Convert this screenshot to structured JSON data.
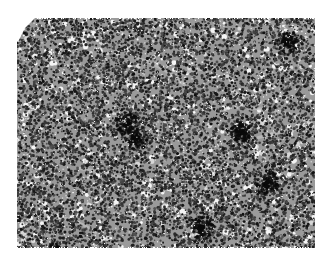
{
  "image": {
    "description": "Grayscale histology micrograph showing a dense sheet of small round dark-staining cells (hematoxylin-stained nuclei) with scattered pale spaces and faint gray fibrous/vascular strands",
    "colors": {
      "background": "#ffffff",
      "nuclei_dark": "#1a1a1a",
      "tissue_mid": "#7a7a7a",
      "stroma_light": "#b8b8b8",
      "spaces": "#f2f2f2"
    },
    "region": {
      "left": 17,
      "top": 18,
      "right": 315,
      "bottom": 248
    },
    "clipped_corner": "top-left"
  }
}
